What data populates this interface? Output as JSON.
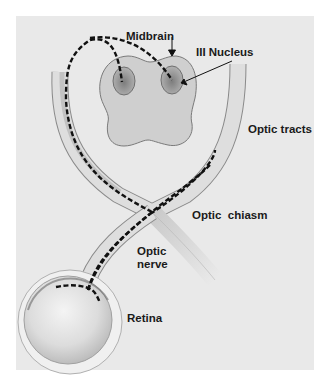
{
  "diagram": {
    "type": "anatomical-illustration",
    "labels": {
      "midbrain": "Midbrain",
      "nucleus": "III Nucleus",
      "optic_tracts": "Optic tracts",
      "optic_chiasm": "Optic  chiasm",
      "optic_nerve_line1": "Optic",
      "optic_nerve_line2": "nerve",
      "retina": "Retina"
    },
    "colors": {
      "background_panel": "#e9e9e9",
      "page": "#ffffff",
      "structure_fill": "#d6d6d6",
      "structure_outline": "#8a8a8a",
      "nucleus_fill": "#a8a8a8",
      "pathway": "#111111",
      "label_text": "#1a1a1a"
    }
  }
}
